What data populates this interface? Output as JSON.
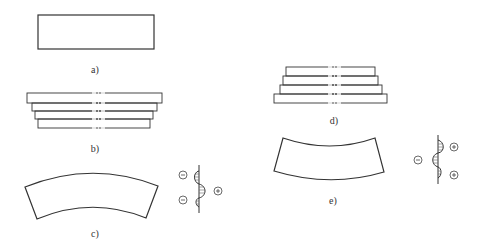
{
  "figure": {
    "panels": [
      {
        "id": "a",
        "label": "a)",
        "description": "Flat rectangular plate (undeformed)"
      },
      {
        "id": "b",
        "label": "b)",
        "description": "Stacked layers, wider at top (stepped)"
      },
      {
        "id": "c",
        "label": "c)",
        "description": "Plate bent convex upward with residual stress distribution"
      },
      {
        "id": "d",
        "label": "d)",
        "description": "Stacked layers, wider at bottom (stepped)"
      },
      {
        "id": "e",
        "label": "e)",
        "description": "Plate bent concave upward with residual stress distribution"
      }
    ],
    "stress_c": {
      "signs": [
        "−",
        "+",
        "−"
      ]
    },
    "stress_e": {
      "signs": [
        "+",
        "−",
        "+"
      ]
    },
    "colors": {
      "stroke": "#333333",
      "hatch": "#555555",
      "background": "#ffffff"
    }
  }
}
